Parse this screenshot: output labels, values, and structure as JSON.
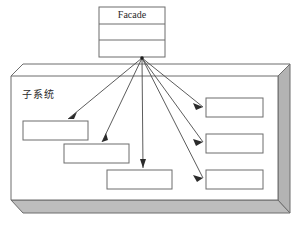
{
  "diagram": {
    "type": "uml-facade-pattern",
    "background_color": "#ffffff",
    "stroke_color": "#6d6d6d",
    "arrow_color": "#2b2b2b",
    "panel_shade_color": "#b3b3b3",
    "facade_class": {
      "name": "Facade",
      "compartments": [
        "Facade",
        "",
        ""
      ],
      "x": 99,
      "y": 7,
      "width": 66,
      "height": 50
    },
    "subsystem_panel": {
      "label": "子系统",
      "label_x": 22,
      "label_y": 95,
      "x": 11,
      "y": 76,
      "width": 267,
      "height": 124
    },
    "subsystem_boxes": [
      {
        "id": "subsystem-box-1",
        "label": "",
        "x": 23,
        "y": 121,
        "width": 65,
        "height": 19
      },
      {
        "id": "subsystem-box-2",
        "label": "",
        "x": 64,
        "y": 144,
        "width": 65,
        "height": 19
      },
      {
        "id": "subsystem-box-3",
        "label": "",
        "x": 107,
        "y": 170,
        "width": 65,
        "height": 19
      },
      {
        "id": "subsystem-box-4",
        "label": "",
        "x": 206,
        "y": 98,
        "width": 57,
        "height": 19
      },
      {
        "id": "subsystem-box-5",
        "label": "",
        "x": 206,
        "y": 134,
        "width": 57,
        "height": 19
      },
      {
        "id": "subsystem-box-6",
        "label": "",
        "x": 206,
        "y": 170,
        "width": 57,
        "height": 19
      }
    ],
    "arrow_origin": {
      "x": 142,
      "y": 58
    },
    "arrows": [
      {
        "id": "arrow-to-subsystem-1",
        "from_x": 142,
        "from_y": 58,
        "to_x": 68,
        "to_y": 119
      },
      {
        "id": "arrow-to-subsystem-2",
        "from_x": 142,
        "from_y": 58,
        "to_x": 102,
        "to_y": 142
      },
      {
        "id": "arrow-to-subsystem-3",
        "from_x": 142,
        "from_y": 58,
        "to_x": 143,
        "to_y": 168
      },
      {
        "id": "arrow-to-subsystem-4",
        "from_x": 142,
        "from_y": 58,
        "to_x": 203,
        "to_y": 107
      },
      {
        "id": "arrow-to-subsystem-5",
        "from_x": 142,
        "from_y": 58,
        "to_x": 203,
        "to_y": 142
      },
      {
        "id": "arrow-to-subsystem-6",
        "from_x": 142,
        "from_y": 58,
        "to_x": 203,
        "to_y": 178
      }
    ]
  }
}
